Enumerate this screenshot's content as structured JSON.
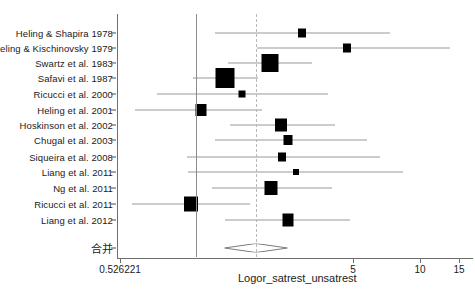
{
  "chart_data": {
    "type": "forest",
    "title": "",
    "xlabel": "Logor_satrest_unsatrest",
    "ylabel": "",
    "x_ticks": [
      {
        "label": "0.526221",
        "value": 0.526221,
        "px": 120
      },
      {
        "label": "5",
        "value": 5,
        "px": 353
      },
      {
        "label": "10",
        "value": 10,
        "px": 420
      },
      {
        "label": "15",
        "value": 15,
        "px": 459
      }
    ],
    "reference_lines": [
      {
        "name": "null-line",
        "px": 196,
        "style": "solid"
      },
      {
        "name": "pooled-line",
        "px": 256,
        "style": "dashed"
      }
    ],
    "summary_label": "合并",
    "summary": {
      "center_px": 256,
      "left_px": 225,
      "right_px": 288,
      "y_px": 248
    },
    "studies": [
      {
        "label": "Heling & Shapira 1978",
        "y_px": 33,
        "marker_px": 302,
        "marker_w": 8,
        "marker_h": 9,
        "ci_left_px": 215,
        "ci_right_px": 390
      },
      {
        "label": "Heling & Kischinovsky 1979",
        "y_px": 48,
        "marker_px": 347,
        "marker_w": 8,
        "marker_h": 9,
        "ci_left_px": 257,
        "ci_right_px": 450
      },
      {
        "label": "Swartz et al. 1983",
        "y_px": 63,
        "marker_px": 270,
        "marker_w": 17,
        "marker_h": 18,
        "ci_left_px": 228,
        "ci_right_px": 312
      },
      {
        "label": "Safavi et al. 1987",
        "y_px": 78,
        "marker_px": 225,
        "marker_w": 19,
        "marker_h": 20,
        "ci_left_px": 193,
        "ci_right_px": 258
      },
      {
        "label": "Ricucci et al. 2000",
        "y_px": 94,
        "marker_px": 242,
        "marker_w": 7,
        "marker_h": 7,
        "ci_left_px": 157,
        "ci_right_px": 328
      },
      {
        "label": "Heling et al. 2001",
        "y_px": 110,
        "marker_px": 201,
        "marker_w": 11,
        "marker_h": 12,
        "ci_left_px": 135,
        "ci_right_px": 262
      },
      {
        "label": "Hoskinson et al. 2002",
        "y_px": 125,
        "marker_px": 281,
        "marker_w": 12,
        "marker_h": 13,
        "ci_left_px": 230,
        "ci_right_px": 335
      },
      {
        "label": "Chugal et al. 2003",
        "y_px": 140,
        "marker_px": 288,
        "marker_w": 9,
        "marker_h": 10,
        "ci_left_px": 215,
        "ci_right_px": 367
      },
      {
        "label": "Siqueira et al. 2008",
        "y_px": 157,
        "marker_px": 282,
        "marker_w": 8,
        "marker_h": 9,
        "ci_left_px": 187,
        "ci_right_px": 380
      },
      {
        "label": "Liang et al. 2011",
        "y_px": 172,
        "marker_px": 296,
        "marker_w": 6,
        "marker_h": 6,
        "ci_left_px": 188,
        "ci_right_px": 403
      },
      {
        "label": "Ng et al. 2011",
        "y_px": 188,
        "marker_px": 271,
        "marker_w": 13,
        "marker_h": 14,
        "ci_left_px": 212,
        "ci_right_px": 332
      },
      {
        "label": "Ricucci et al. 2011",
        "y_px": 204,
        "marker_px": 191,
        "marker_w": 14,
        "marker_h": 15,
        "ci_left_px": 132,
        "ci_right_px": 250
      },
      {
        "label": "Liang et al. 2012",
        "y_px": 220,
        "marker_px": 288,
        "marker_w": 11,
        "marker_h": 13,
        "ci_left_px": 225,
        "ci_right_px": 350
      }
    ]
  }
}
